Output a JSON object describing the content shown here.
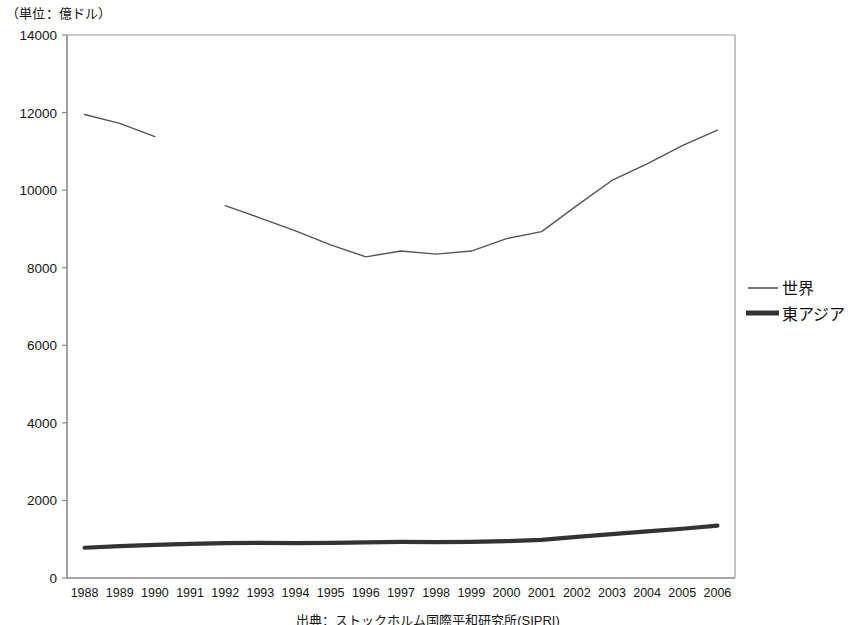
{
  "unit_note": "（単位：億ドル）",
  "source_note": "出典：ストックホルム国際平和研究所(SIPRI)",
  "legend": {
    "world_label": "世界",
    "east_asia_label": "東アジア"
  },
  "colors": {
    "world_line": "#555555",
    "east_asia_line": "#333333",
    "axis": "#8a8a8a",
    "text": "#161616",
    "background": "#ffffff"
  },
  "chart_data": {
    "type": "line",
    "title": "",
    "subtitle": "",
    "xlabel": "",
    "ylabel": "（単位：億ドル）",
    "ylim": [
      0,
      14000
    ],
    "ytick_values": [
      0,
      2000,
      4000,
      6000,
      8000,
      10000,
      12000,
      14000
    ],
    "ytick_labels": [
      "0",
      "2000",
      "4000",
      "6000",
      "8000",
      "10000",
      "12000",
      "14000"
    ],
    "grid": false,
    "legend_position": "right",
    "categories": [
      1988,
      1989,
      1990,
      1991,
      1992,
      1993,
      1994,
      1995,
      1996,
      1997,
      1998,
      1999,
      2000,
      2001,
      2002,
      2003,
      2004,
      2005,
      2006
    ],
    "xtick_labels": [
      "1988",
      "1989",
      "1990",
      "1991",
      "1992",
      "1993",
      "1994",
      "1995",
      "1996",
      "1997",
      "1998",
      "1999",
      "2000",
      "2001",
      "2002",
      "2003",
      "2004",
      "2005",
      "2006"
    ],
    "series": [
      {
        "name": "世界",
        "line_width": 1.4,
        "color": "#555555",
        "values": [
          11950,
          11720,
          11380,
          null,
          9600,
          9280,
          8950,
          8590,
          8280,
          8430,
          8350,
          8430,
          8750,
          8930,
          9600,
          10250,
          10680,
          11150,
          11550
        ]
      },
      {
        "name": "東アジア",
        "line_width": 4.2,
        "color": "#333333",
        "values": [
          780,
          820,
          855,
          880,
          900,
          905,
          900,
          905,
          920,
          930,
          925,
          930,
          950,
          985,
          1060,
          1130,
          1200,
          1270,
          1350
        ]
      }
    ]
  }
}
